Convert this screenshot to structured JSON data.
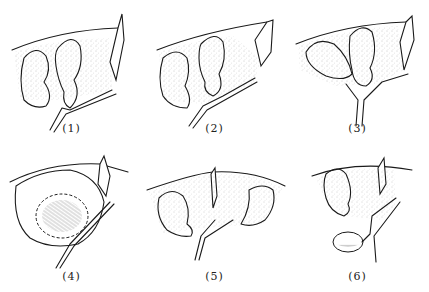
{
  "figure": {
    "panels": [
      {
        "id": 1,
        "label": "(1)"
      },
      {
        "id": 2,
        "label": "(2)"
      },
      {
        "id": 3,
        "label": "(3)"
      },
      {
        "id": 4,
        "label": "(4)"
      },
      {
        "id": 5,
        "label": "(5)"
      },
      {
        "id": 6,
        "label": "(6)"
      }
    ],
    "layout": {
      "rows": 2,
      "cols": 3
    }
  }
}
